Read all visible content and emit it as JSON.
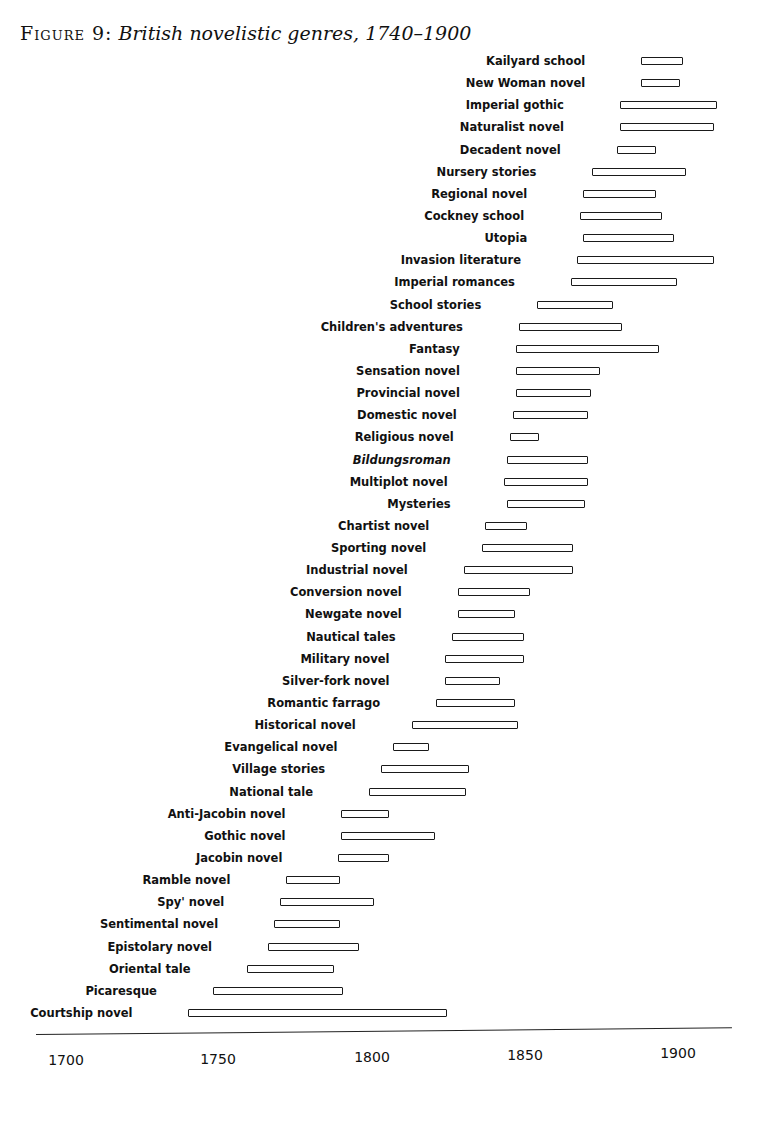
{
  "title": {
    "figure": "Figure 9:",
    "text": "British novelistic genres, 1740–1900"
  },
  "chart_data": {
    "type": "bar",
    "orientation": "horizontal-range",
    "title": "Figure 9: British novelistic genres, 1740–1900",
    "xlabel": "",
    "ylabel": "",
    "xlim": [
      1700,
      1920
    ],
    "xticks": [
      "1700",
      "1750",
      "1800",
      "1850",
      "1900"
    ],
    "grid": false,
    "legend": null,
    "series": [
      {
        "name": "Kailyard school",
        "start": 1888,
        "end": 1902
      },
      {
        "name": "New Woman novel",
        "start": 1888,
        "end": 1901
      },
      {
        "name": "Imperial gothic",
        "start": 1881,
        "end": 1913
      },
      {
        "name": "Naturalist novel",
        "start": 1881,
        "end": 1912
      },
      {
        "name": "Decadent novel",
        "start": 1880,
        "end": 1893
      },
      {
        "name": "Nursery stories",
        "start": 1872,
        "end": 1903
      },
      {
        "name": "Regional novel",
        "start": 1869,
        "end": 1893
      },
      {
        "name": "Cockney school",
        "start": 1868,
        "end": 1895
      },
      {
        "name": "Utopia",
        "start": 1869,
        "end": 1899
      },
      {
        "name": "Invasion literature",
        "start": 1867,
        "end": 1912
      },
      {
        "name": "Imperial romances",
        "start": 1865,
        "end": 1900
      },
      {
        "name": "School stories",
        "start": 1854,
        "end": 1879
      },
      {
        "name": "Children's adventures",
        "start": 1848,
        "end": 1882
      },
      {
        "name": "Fantasy",
        "start": 1847,
        "end": 1894
      },
      {
        "name": "Sensation novel",
        "start": 1847,
        "end": 1875
      },
      {
        "name": "Provincial novel",
        "start": 1847,
        "end": 1872
      },
      {
        "name": "Domestic novel",
        "start": 1846,
        "end": 1871
      },
      {
        "name": "Religious novel",
        "start": 1845,
        "end": 1855
      },
      {
        "name": "Bildungsroman",
        "start": 1844,
        "end": 1871,
        "italic": true
      },
      {
        "name": "Multiplot novel",
        "start": 1843,
        "end": 1871
      },
      {
        "name": "Mysteries",
        "start": 1844,
        "end": 1870
      },
      {
        "name": "Chartist novel",
        "start": 1837,
        "end": 1851
      },
      {
        "name": "Sporting novel",
        "start": 1836,
        "end": 1866
      },
      {
        "name": "Industrial novel",
        "start": 1830,
        "end": 1866
      },
      {
        "name": "Conversion novel",
        "start": 1828,
        "end": 1852
      },
      {
        "name": "Newgate novel",
        "start": 1828,
        "end": 1847
      },
      {
        "name": "Nautical tales",
        "start": 1826,
        "end": 1850
      },
      {
        "name": "Military novel",
        "start": 1824,
        "end": 1850
      },
      {
        "name": "Silver-fork novel",
        "start": 1824,
        "end": 1842
      },
      {
        "name": "Romantic farrago",
        "start": 1821,
        "end": 1847
      },
      {
        "name": "Historical novel",
        "start": 1813,
        "end": 1848
      },
      {
        "name": "Evangelical novel",
        "start": 1807,
        "end": 1819
      },
      {
        "name": "Village stories",
        "start": 1803,
        "end": 1832
      },
      {
        "name": "National tale",
        "start": 1799,
        "end": 1831
      },
      {
        "name": "Anti-Jacobin novel",
        "start": 1790,
        "end": 1806
      },
      {
        "name": "Gothic novel",
        "start": 1790,
        "end": 1821
      },
      {
        "name": "Jacobin novel",
        "start": 1789,
        "end": 1806
      },
      {
        "name": "Ramble novel",
        "start": 1772,
        "end": 1790
      },
      {
        "name": "Spy' novel",
        "start": 1770,
        "end": 1801
      },
      {
        "name": "Sentimental novel",
        "start": 1768,
        "end": 1790
      },
      {
        "name": "Epistolary novel",
        "start": 1766,
        "end": 1796
      },
      {
        "name": "Oriental tale",
        "start": 1759,
        "end": 1788
      },
      {
        "name": "Picaresque",
        "start": 1748,
        "end": 1791
      },
      {
        "name": "Courtship novel",
        "start": 1740,
        "end": 1825
      }
    ]
  },
  "axis": {
    "ticks": [
      {
        "label": "1700",
        "x": 66,
        "y": 1060
      },
      {
        "label": "1750",
        "x": 218,
        "y": 1059
      },
      {
        "label": "1800",
        "x": 372,
        "y": 1057
      },
      {
        "label": "1850",
        "x": 525,
        "y": 1055
      },
      {
        "label": "1900",
        "x": 678,
        "y": 1053
      }
    ]
  },
  "colors": {
    "ink": "#111111",
    "background": "#ffffff"
  }
}
